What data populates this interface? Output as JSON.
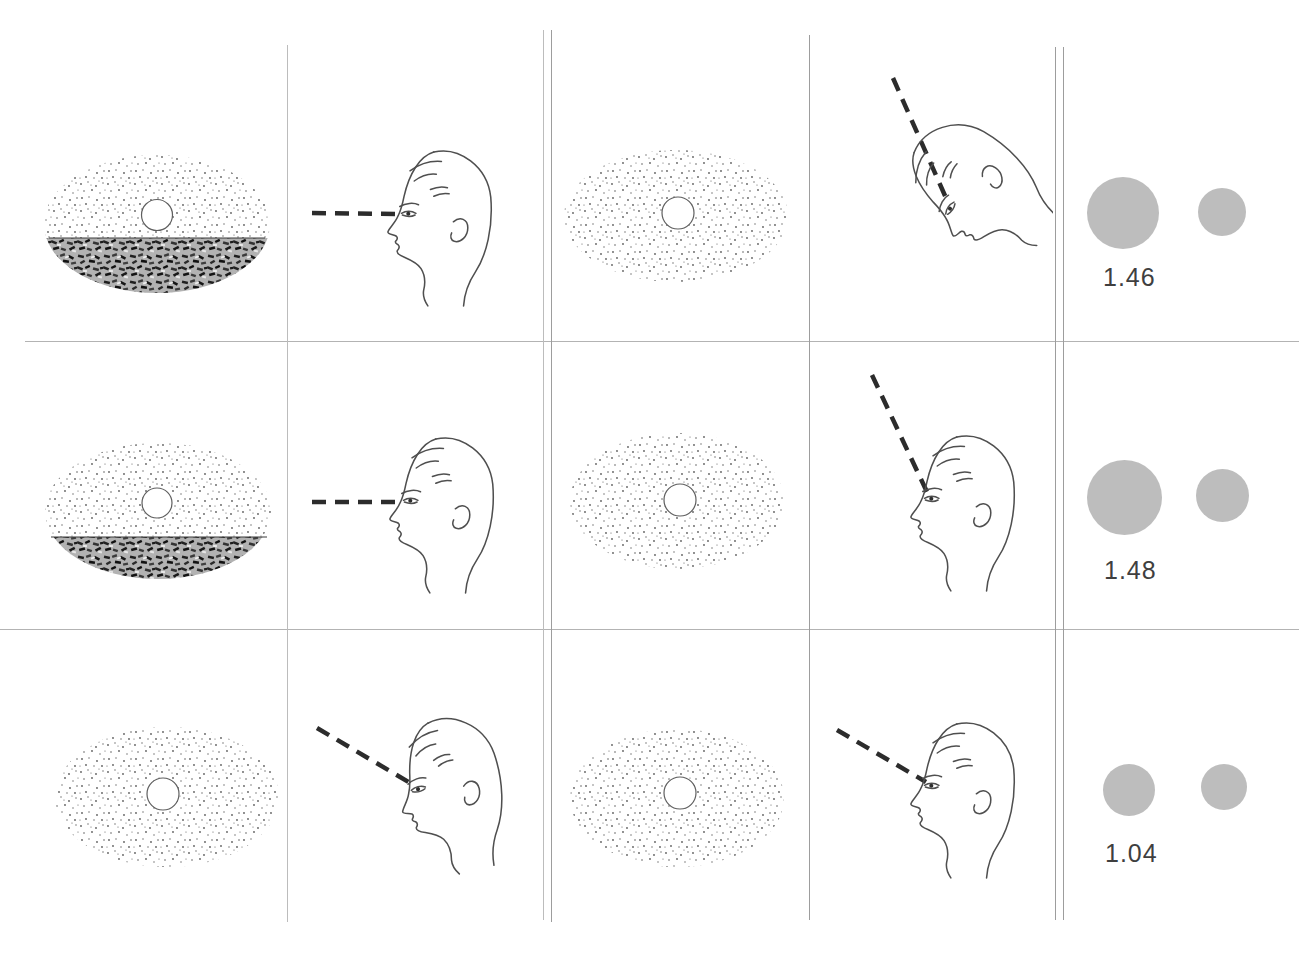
{
  "figure": {
    "grid": {
      "rows": 3,
      "columns": 5
    },
    "colors": {
      "disc_gray": "#bdbdbd",
      "ink": "#3f3f3f",
      "grid_line": "#9d9d9d",
      "dash_line": "#2c2c2c"
    },
    "rows": [
      {
        "stimulus_left": "moon at horizon above dark textured terrain",
        "observer_left": "head upright, gaze level (horizontal dashed sight line)",
        "stimulus_right": "elevated moon centered in stippled field",
        "observer_right": "head tilted far back, sight line raised about 65 degrees",
        "disc_large_px": 72,
        "disc_small_px": 48,
        "ratio": "1.46"
      },
      {
        "stimulus_left": "moon at horizon above dark textured terrain",
        "observer_left": "head upright, gaze level (horizontal dashed sight line)",
        "stimulus_right": "elevated moon centered in stippled field",
        "observer_right": "head upright, eyes raised, sight line about 64 degrees",
        "disc_large_px": 75,
        "disc_small_px": 53,
        "ratio": "1.48"
      },
      {
        "stimulus_left": "elevated moon centered in stippled field",
        "observer_left": "head tilted back slightly, sight line about 30 degrees",
        "stimulus_right": "elevated moon centered in stippled field",
        "observer_right": "head upright, sight line about 30 degrees",
        "disc_large_px": 52,
        "disc_small_px": 46,
        "ratio": "1.04"
      }
    ],
    "moon_radius_px": 16
  }
}
